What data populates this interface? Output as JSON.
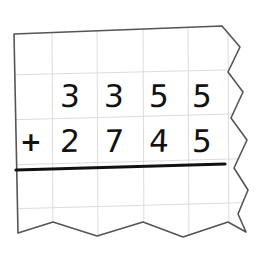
{
  "document": {
    "type": "math-worksheet-scrap",
    "description": "Torn piece of grid/graph paper with a handwritten column addition problem"
  },
  "paper": {
    "background_color": "#ffffff",
    "edge_color": "#4a4a4a",
    "grid_color": "#dcdcdc",
    "torn_edges": [
      "right",
      "bottom"
    ],
    "straight_edges": [
      "left",
      "top"
    ]
  },
  "problem": {
    "type": "column-addition",
    "operator": "+",
    "addend_top": {
      "value": "3355",
      "digits": [
        "3",
        "3",
        "5",
        "5"
      ]
    },
    "addend_bottom": {
      "value": "2745",
      "digits": [
        "2",
        "7",
        "4",
        "5"
      ]
    },
    "answer": {
      "value": "",
      "digits": [
        "",
        "",
        "",
        ""
      ],
      "filled": false
    },
    "answer_rule": {
      "present": true,
      "color": "#111111",
      "thickness_px": 3
    }
  },
  "grid": {
    "columns": 6,
    "rows": 5,
    "vertical_lines_x": [
      52,
      97,
      143,
      188,
      228
    ],
    "horizontal_lines_y": [
      74,
      118,
      163,
      207
    ]
  }
}
